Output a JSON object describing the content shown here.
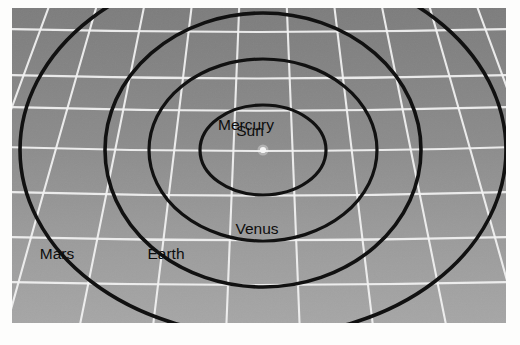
{
  "figure": {
    "kind": "solar-system-orbit-diagram",
    "background_color": "#8e8e8e",
    "grid_line_color": "#f2f2f2",
    "orbit_line_color": "#111111",
    "sun_marker_color": "#f5f5f5",
    "plate": {
      "x": 12,
      "y": 8,
      "width": 494,
      "height": 315
    }
  },
  "labels": {
    "sun": "Sun",
    "mercury": "Mercury",
    "venus": "Venus",
    "earth": "Earth",
    "mars": "Mars"
  },
  "chart_data": {
    "type": "scatter",
    "title": "",
    "xlabel": "",
    "ylabel": "",
    "projection": "perspective-plane",
    "center": {
      "x": 263,
      "y": 150,
      "name": "Sun"
    },
    "orbits": [
      {
        "name": "Mercury",
        "order": 1,
        "rx": 63,
        "ry": 45,
        "label_x": 246,
        "label_y": 130,
        "label_anchor": "middle"
      },
      {
        "name": "Venus",
        "order": 2,
        "rx": 114,
        "ry": 91,
        "label_x": 257,
        "label_y": 234,
        "label_anchor": "middle"
      },
      {
        "name": "Earth",
        "order": 3,
        "rx": 158,
        "ry": 137,
        "label_x": 166,
        "label_y": 259,
        "label_anchor": "middle"
      },
      {
        "name": "Mars",
        "order": 4,
        "rx": 243,
        "ry": 186,
        "label_x": 57,
        "label_y": 259,
        "label_anchor": "middle"
      }
    ],
    "grid": {
      "rows": 7,
      "columns": 9,
      "row_y": [
        32,
        78,
        110,
        150,
        195,
        240,
        285
      ],
      "visible": true
    },
    "legend_position": "none"
  }
}
